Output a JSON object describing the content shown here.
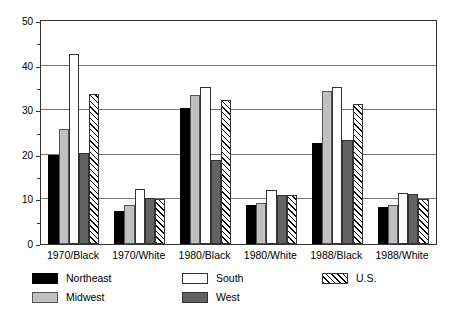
{
  "chart_data": {
    "type": "bar",
    "title": "",
    "subtitle": "",
    "xlabel": "",
    "ylabel": "",
    "ylim": [
      0,
      50
    ],
    "yticks": [
      0,
      10,
      20,
      30,
      40,
      50
    ],
    "yticks_minor": [
      5,
      15,
      25,
      35,
      45
    ],
    "grid": true,
    "grid_axis": "y",
    "legend_position": "below-plot-left",
    "categories": [
      "1970/Black",
      "1970/White",
      "1980/Black",
      "1980/White",
      "1988/Black",
      "1988/White"
    ],
    "series": [
      {
        "name": "Northeast",
        "fill": "solid-black",
        "color": "#000000",
        "values": [
          20.0,
          7.5,
          30.6,
          8.8,
          22.6,
          8.3
        ]
      },
      {
        "name": "Midwest",
        "fill": "solid-light-gray",
        "color": "#c0c0c0",
        "values": [
          25.8,
          8.7,
          33.3,
          9.2,
          34.4,
          8.8
        ]
      },
      {
        "name": "South",
        "fill": "open-white",
        "color": "#ffffff",
        "values": [
          42.7,
          12.3,
          35.1,
          12.2,
          35.1,
          11.4
        ]
      },
      {
        "name": "West",
        "fill": "solid-dark-gray",
        "color": "#636363",
        "values": [
          20.4,
          10.3,
          18.9,
          11.1,
          23.4,
          11.2
        ]
      },
      {
        "name": "U.S.",
        "fill": "diagonal-hatch",
        "color": "#ffffff",
        "values": [
          33.7,
          10.2,
          32.3,
          11.1,
          31.4,
          10.1
        ]
      }
    ]
  },
  "axes": {
    "y_tick_labels": [
      "0",
      "10",
      "20",
      "30",
      "40",
      "50"
    ]
  },
  "legend": {
    "entries": [
      {
        "label": "Northeast"
      },
      {
        "label": "Midwest"
      },
      {
        "label": "South"
      },
      {
        "label": "West"
      },
      {
        "label": "U.S."
      }
    ]
  }
}
